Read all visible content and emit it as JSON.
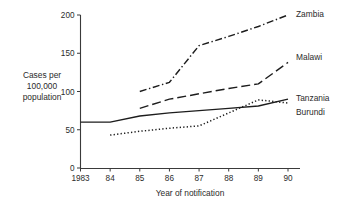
{
  "chart_data": {
    "type": "line",
    "title": "",
    "xlabel": "Year of notification",
    "ylabel": "Cases per 100,000 population",
    "ylabel_lines": [
      "Cases per",
      "100,000",
      "population"
    ],
    "x": [
      1983,
      1984,
      1985,
      1986,
      1987,
      1988,
      1989,
      1990
    ],
    "xtick_labels": [
      "1983",
      "84",
      "85",
      "86",
      "87",
      "88",
      "89",
      "90"
    ],
    "ytick_labels": [
      "0",
      "50",
      "100",
      "150",
      "200"
    ],
    "ytick_values": [
      0,
      50,
      100,
      150,
      200
    ],
    "ylim": [
      0,
      200
    ],
    "xlim": [
      1983,
      1990
    ],
    "grid": false,
    "legend_position": "right-inline",
    "series": [
      {
        "name": "Zambia",
        "style": "dash-dot",
        "color": "#1d1d1d",
        "x": [
          1985,
          1986,
          1987,
          1988,
          1989,
          1990
        ],
        "values": [
          100,
          112,
          160,
          172,
          185,
          200
        ]
      },
      {
        "name": "Malawi",
        "style": "long-dash",
        "color": "#1d1d1d",
        "x": [
          1985,
          1986,
          1987,
          1988,
          1989,
          1990
        ],
        "values": [
          78,
          90,
          97,
          104,
          110,
          138
        ]
      },
      {
        "name": "Tanzania",
        "style": "solid",
        "color": "#1d1d1d",
        "x": [
          1983,
          1984,
          1985,
          1986,
          1987,
          1988,
          1989,
          1990
        ],
        "values": [
          60,
          60,
          68,
          72,
          75,
          78,
          81,
          90
        ]
      },
      {
        "name": "Burundi",
        "style": "dotted",
        "color": "#1d1d1d",
        "x": [
          1984,
          1985,
          1986,
          1987,
          1988,
          1989,
          1990
        ],
        "values": [
          43,
          48,
          52,
          55,
          72,
          89,
          85
        ]
      }
    ]
  }
}
